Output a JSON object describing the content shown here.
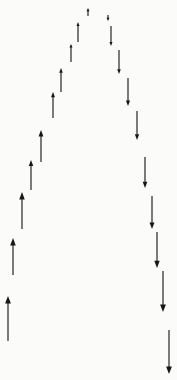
{
  "figure": {
    "title": "Arrow Peak Diagram",
    "background_color": "#fbfbfa",
    "arrow_color": "#1c1c1c",
    "width": 177,
    "height": 380
  },
  "chart_data": {
    "type": "scatter",
    "title": "Arrow Peak Diagram",
    "subtitle": "",
    "xlabel": "",
    "ylabel": "",
    "xlim": [
      0,
      177
    ],
    "ylim": [
      0,
      380
    ],
    "grid": false,
    "legend": null,
    "annotations": [],
    "tick_labels": {
      "x": [],
      "y": []
    },
    "series": [
      {
        "name": "up-arrows",
        "direction": "up",
        "marker": "arrow",
        "color": "#1c1c1c",
        "points": [
          {
            "x": 8,
            "y_tail": 341,
            "y_head": 296,
            "length": 45
          },
          {
            "x": 13,
            "y_tail": 275,
            "y_head": 238,
            "length": 37
          },
          {
            "x": 22,
            "y_tail": 229,
            "y_head": 192,
            "length": 37
          },
          {
            "x": 31,
            "y_tail": 190,
            "y_head": 160,
            "length": 30
          },
          {
            "x": 41,
            "y_tail": 162,
            "y_head": 130,
            "length": 32
          },
          {
            "x": 53,
            "y_tail": 118,
            "y_head": 92,
            "length": 26
          },
          {
            "x": 61,
            "y_tail": 92,
            "y_head": 68,
            "length": 24
          },
          {
            "x": 71,
            "y_tail": 62,
            "y_head": 44,
            "length": 18
          },
          {
            "x": 78,
            "y_tail": 42,
            "y_head": 22,
            "length": 20
          },
          {
            "x": 88,
            "y_tail": 16,
            "y_head": 8,
            "length": 8
          }
        ]
      },
      {
        "name": "down-arrows",
        "direction": "down",
        "marker": "arrow",
        "color": "#1c1c1c",
        "points": [
          {
            "x": 108,
            "y_tail": 15,
            "y_head": 21,
            "length": 6
          },
          {
            "x": 111,
            "y_tail": 26,
            "y_head": 46,
            "length": 20
          },
          {
            "x": 119,
            "y_tail": 50,
            "y_head": 74,
            "length": 24
          },
          {
            "x": 128,
            "y_tail": 78,
            "y_head": 106,
            "length": 28
          },
          {
            "x": 137,
            "y_tail": 111,
            "y_head": 140,
            "length": 29
          },
          {
            "x": 145,
            "y_tail": 157,
            "y_head": 188,
            "length": 31
          },
          {
            "x": 152,
            "y_tail": 196,
            "y_head": 229,
            "length": 33
          },
          {
            "x": 157,
            "y_tail": 232,
            "y_head": 268,
            "length": 36
          },
          {
            "x": 163,
            "y_tail": 271,
            "y_head": 312,
            "length": 41
          },
          {
            "x": 169,
            "y_tail": 330,
            "y_head": 374,
            "length": 44
          }
        ]
      }
    ]
  }
}
